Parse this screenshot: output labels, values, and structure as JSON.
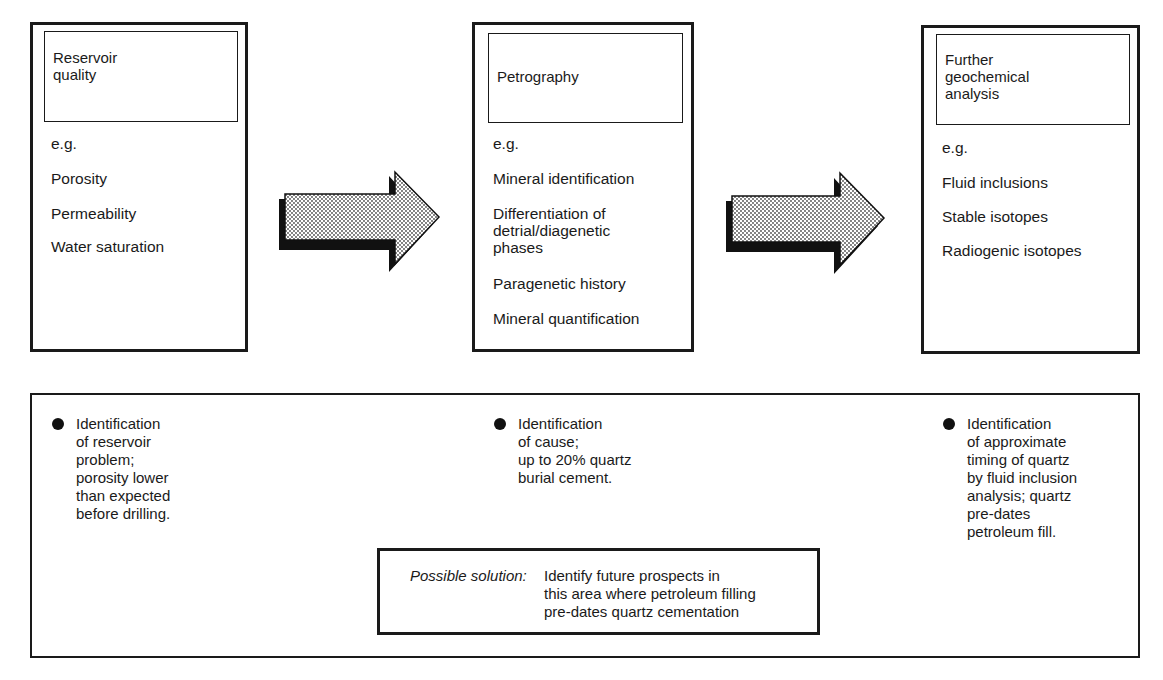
{
  "stages": [
    {
      "title": "Reservoir\nquality",
      "title_lines": [
        "Reservoir",
        "quality"
      ],
      "eg": "e.g.",
      "items": [
        "Porosity",
        "Permeability",
        "Water saturation"
      ]
    },
    {
      "title_lines": [
        "Petrography"
      ],
      "eg": "e.g.",
      "items": [
        "Mineral identification",
        "Differentiation of",
        "detrial/diagenetic",
        "phases",
        "Paragenetic history",
        "Mineral quantification"
      ]
    },
    {
      "title_lines": [
        "Further",
        "geochemical",
        "analysis"
      ],
      "eg": "e.g.",
      "items": [
        "Fluid inclusions",
        "Stable isotopes",
        "Radiogenic isotopes"
      ]
    }
  ],
  "arrows": [
    {
      "icon": "right-arrow-icon",
      "fill": "stippled-grey"
    },
    {
      "icon": "right-arrow-icon",
      "fill": "stippled-grey"
    }
  ],
  "findings": [
    {
      "text": "Identification\nof reservoir\nproblem;\nporosity lower\nthan expected\nbefore drilling."
    },
    {
      "text": "Identification\nof cause;\nup to 20% quartz\nburial cement."
    },
    {
      "text": "Identification\nof approximate\ntiming of quartz\nby fluid inclusion\nanalysis; quartz\npre-dates\npetroleum fill."
    }
  ],
  "solution": {
    "label": "Possible solution:",
    "text": "Identify future prospects in\nthis area where petroleum filling\npre-dates quartz cementation"
  },
  "colors": {
    "ink": "#1a1a1a",
    "background": "#ffffff",
    "stipple": "#bdbdbd"
  }
}
